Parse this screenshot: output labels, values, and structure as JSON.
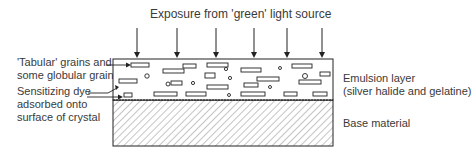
{
  "title": "Exposure from 'green' light source",
  "labels": {
    "grains": [
      "'Tabular' grains and",
      "some globular grains"
    ],
    "dye": [
      "Sensitizing dye",
      "adsorbed onto",
      "surface of crystal"
    ],
    "emulsion": [
      "Emulsion layer",
      "(silver halide and gelatine)"
    ],
    "base": "Base material"
  },
  "arrows_x": [
    137,
    177,
    216,
    254,
    287,
    322
  ],
  "colors": {
    "line": "#222222",
    "text": "#3a3a3a"
  }
}
